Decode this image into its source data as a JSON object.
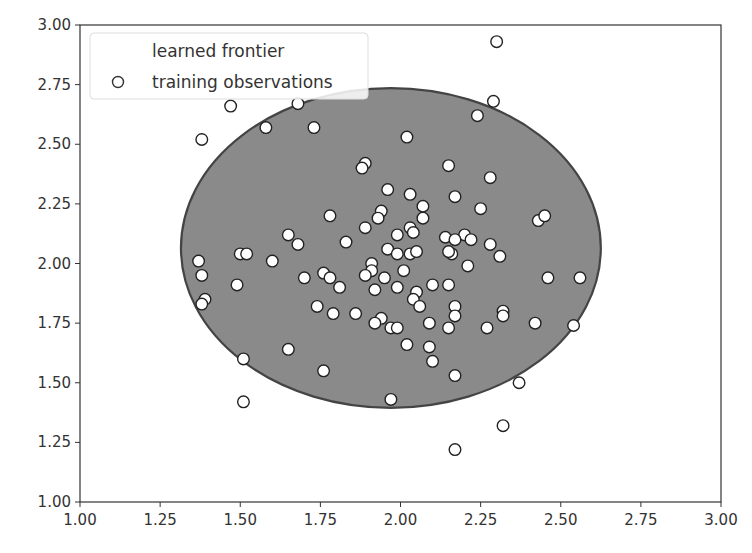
{
  "chart_data": {
    "type": "scatter",
    "title": "",
    "xlabel": "",
    "ylabel": "",
    "xlim": [
      1.0,
      3.0
    ],
    "ylim": [
      1.0,
      3.0
    ],
    "grid": false,
    "legend_position": "upper left",
    "x_ticks": [
      "1.00",
      "1.25",
      "1.50",
      "1.75",
      "2.00",
      "2.25",
      "2.50",
      "2.75",
      "3.00"
    ],
    "y_ticks": [
      "1.00",
      "1.25",
      "1.50",
      "1.75",
      "2.00",
      "2.25",
      "2.50",
      "2.75",
      "3.00"
    ],
    "legend": [
      {
        "label": "learned frontier",
        "marker": "none"
      },
      {
        "label": "training observations",
        "marker": "open-circle"
      }
    ],
    "frontier": {
      "shape": "ellipse",
      "center": [
        1.97,
        2.065
      ],
      "rx": 0.655,
      "ry": 0.67,
      "fill": "#8a8a8a",
      "edge": "#444444"
    },
    "series": [
      {
        "name": "training observations",
        "marker": "circle",
        "facecolor": "#ffffff",
        "edgecolor": "#222222",
        "points": [
          [
            2.3,
            2.93
          ],
          [
            1.47,
            2.66
          ],
          [
            1.68,
            2.67
          ],
          [
            2.29,
            2.68
          ],
          [
            1.58,
            2.57
          ],
          [
            1.73,
            2.57
          ],
          [
            2.24,
            2.62
          ],
          [
            1.38,
            2.52
          ],
          [
            2.02,
            2.53
          ],
          [
            1.89,
            2.42
          ],
          [
            1.88,
            2.4
          ],
          [
            2.15,
            2.41
          ],
          [
            2.28,
            2.36
          ],
          [
            1.96,
            2.31
          ],
          [
            2.03,
            2.29
          ],
          [
            2.17,
            2.28
          ],
          [
            1.94,
            2.22
          ],
          [
            2.07,
            2.24
          ],
          [
            2.25,
            2.23
          ],
          [
            1.78,
            2.2
          ],
          [
            1.93,
            2.19
          ],
          [
            2.07,
            2.19
          ],
          [
            2.43,
            2.18
          ],
          [
            2.45,
            2.2
          ],
          [
            1.89,
            2.15
          ],
          [
            2.03,
            2.15
          ],
          [
            2.04,
            2.13
          ],
          [
            1.65,
            2.12
          ],
          [
            1.99,
            2.12
          ],
          [
            2.14,
            2.11
          ],
          [
            2.2,
            2.12
          ],
          [
            2.17,
            2.1
          ],
          [
            2.22,
            2.1
          ],
          [
            2.28,
            2.08
          ],
          [
            1.68,
            2.08
          ],
          [
            1.83,
            2.09
          ],
          [
            1.96,
            2.06
          ],
          [
            2.16,
            2.04
          ],
          [
            2.15,
            2.05
          ],
          [
            2.31,
            2.03
          ],
          [
            1.5,
            2.04
          ],
          [
            1.52,
            2.04
          ],
          [
            2.03,
            2.04
          ],
          [
            2.05,
            2.05
          ],
          [
            1.99,
            2.04
          ],
          [
            1.37,
            2.01
          ],
          [
            1.6,
            2.01
          ],
          [
            1.91,
            2.0
          ],
          [
            2.21,
            1.99
          ],
          [
            1.91,
            1.97
          ],
          [
            2.01,
            1.97
          ],
          [
            1.38,
            1.95
          ],
          [
            1.76,
            1.96
          ],
          [
            1.89,
            1.95
          ],
          [
            1.95,
            1.94
          ],
          [
            1.7,
            1.94
          ],
          [
            1.78,
            1.94
          ],
          [
            2.46,
            1.94
          ],
          [
            2.56,
            1.94
          ],
          [
            1.49,
            1.91
          ],
          [
            1.81,
            1.9
          ],
          [
            1.92,
            1.89
          ],
          [
            1.99,
            1.9
          ],
          [
            2.1,
            1.91
          ],
          [
            2.15,
            1.91
          ],
          [
            2.05,
            1.88
          ],
          [
            2.17,
            1.82
          ],
          [
            1.39,
            1.85
          ],
          [
            1.38,
            1.83
          ],
          [
            2.04,
            1.85
          ],
          [
            2.06,
            1.82
          ],
          [
            1.74,
            1.82
          ],
          [
            1.79,
            1.79
          ],
          [
            1.86,
            1.79
          ],
          [
            1.94,
            1.77
          ],
          [
            2.32,
            1.8
          ],
          [
            2.32,
            1.78
          ],
          [
            2.17,
            1.78
          ],
          [
            1.92,
            1.75
          ],
          [
            2.09,
            1.75
          ],
          [
            1.97,
            1.73
          ],
          [
            1.99,
            1.73
          ],
          [
            2.15,
            1.73
          ],
          [
            2.27,
            1.73
          ],
          [
            2.42,
            1.75
          ],
          [
            2.54,
            1.74
          ],
          [
            2.02,
            1.66
          ],
          [
            2.09,
            1.65
          ],
          [
            1.65,
            1.64
          ],
          [
            1.51,
            1.6
          ],
          [
            2.1,
            1.59
          ],
          [
            1.76,
            1.55
          ],
          [
            2.17,
            1.53
          ],
          [
            2.37,
            1.5
          ],
          [
            1.97,
            1.43
          ],
          [
            1.51,
            1.42
          ],
          [
            2.32,
            1.32
          ],
          [
            2.17,
            1.22
          ]
        ]
      }
    ]
  },
  "axes": {
    "left_px": 80,
    "top_px": 25,
    "right_px": 721,
    "bottom_px": 502
  }
}
